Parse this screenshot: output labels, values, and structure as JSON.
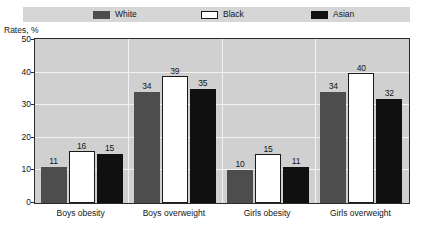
{
  "figure": {
    "title_remnant": "",
    "axis_title": "Rates, %"
  },
  "legend": {
    "items": [
      {
        "label": "White",
        "swatch": "dark-gray-swatch-icon",
        "color": "#4d4d4d"
      },
      {
        "label": "Black",
        "swatch": "white-swatch-icon",
        "color": "#ffffff"
      },
      {
        "label": "Asian",
        "swatch": "black-swatch-icon",
        "color": "#101010"
      }
    ]
  },
  "axis": {
    "y_ticks": [
      "0",
      "10",
      "20",
      "30",
      "40",
      "50"
    ],
    "y_label": "Rates, %"
  },
  "chart_data": {
    "type": "bar",
    "title": "",
    "xlabel": "",
    "ylabel": "Rates, %",
    "ylim": [
      0,
      50
    ],
    "yticks": [
      0,
      10,
      20,
      30,
      40,
      50
    ],
    "grid": true,
    "legend_position": "top",
    "categories": [
      "Boys obesity",
      "Boys overweight",
      "Girls obesity",
      "Girls overweight"
    ],
    "series": [
      {
        "name": "White",
        "color": "#4d4d4d",
        "values": [
          11,
          34,
          10,
          34
        ]
      },
      {
        "name": "Black",
        "color": "#ffffff",
        "values": [
          16,
          39,
          15,
          40
        ]
      },
      {
        "name": "Asian",
        "color": "#101010",
        "values": [
          15,
          35,
          11,
          32
        ]
      }
    ]
  }
}
